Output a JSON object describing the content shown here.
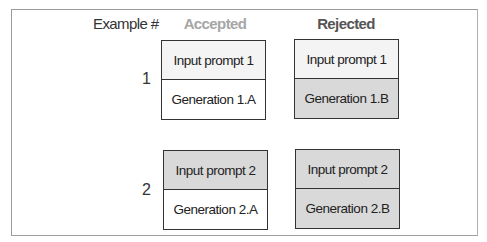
{
  "headers": {
    "example": "Example #",
    "accepted": "Accepted",
    "rejected": "Rejected"
  },
  "colors": {
    "light_fill": "#f4f4f4",
    "white_fill": "#ffffff",
    "gray_fill": "#d9d9d9",
    "accepted_header": "#a6a6a6",
    "rejected_header": "#555555"
  },
  "examples": [
    {
      "number": "1",
      "accepted": {
        "prompt": "Input prompt 1",
        "generation": "Generation 1.A"
      },
      "rejected": {
        "prompt": "Input prompt 1",
        "generation": "Generation 1.B"
      }
    },
    {
      "number": "2",
      "accepted": {
        "prompt": "Input prompt 2",
        "generation": "Generation 2.A"
      },
      "rejected": {
        "prompt": "Input prompt 2",
        "generation": "Generation 2.B"
      }
    }
  ]
}
